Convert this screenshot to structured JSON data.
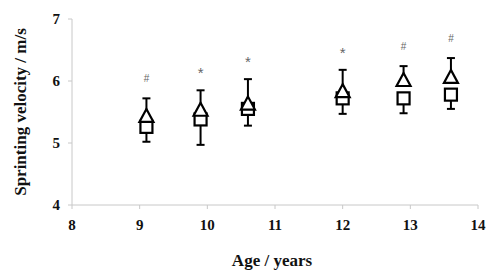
{
  "chart_data": {
    "type": "scatter",
    "title": "",
    "xlabel": "Age / years",
    "ylabel": "Sprinting velocity / m/s",
    "xlim": [
      8,
      14
    ],
    "ylim": [
      4,
      7
    ],
    "x_ticks": [
      "8",
      "9",
      "10",
      "11",
      "12",
      "13",
      "14"
    ],
    "y_ticks": [
      "4",
      "5",
      "6",
      "7"
    ],
    "grid": false,
    "legend": null,
    "x": [
      9.1,
      9.9,
      10.6,
      12.0,
      12.9,
      13.6
    ],
    "series": [
      {
        "name": "triangle",
        "marker": "triangle-open",
        "values": [
          5.42,
          5.52,
          5.62,
          5.82,
          6.0,
          6.05
        ],
        "error_upper": [
          5.72,
          5.85,
          6.03,
          6.18,
          6.24,
          6.37
        ]
      },
      {
        "name": "square",
        "marker": "square-open",
        "values": [
          5.26,
          5.38,
          5.55,
          5.72,
          5.72,
          5.78
        ],
        "error_lower": [
          5.02,
          4.97,
          5.28,
          5.47,
          5.48,
          5.55
        ]
      }
    ],
    "annotations": [
      "#",
      "*",
      "*",
      "*",
      "#",
      "#"
    ]
  }
}
